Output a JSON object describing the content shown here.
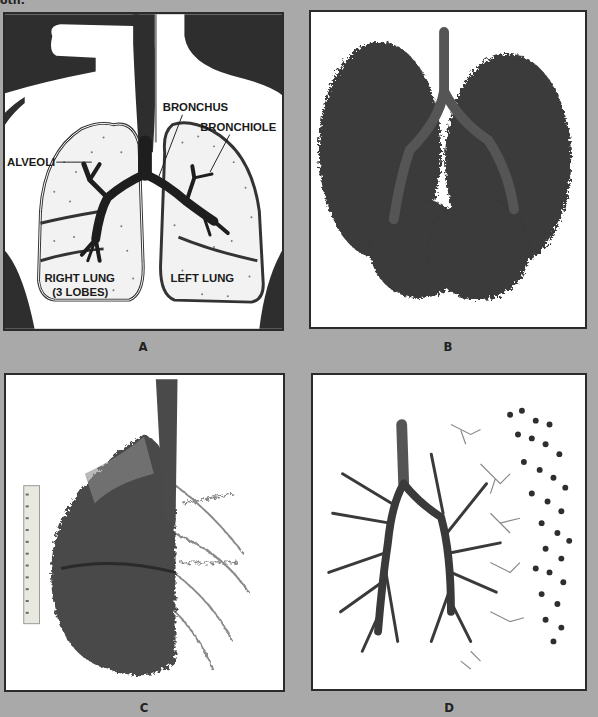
{
  "top_fragment": "oth.",
  "panels": [
    {
      "id": "A",
      "caption": "A",
      "kind": "illustration",
      "labels": {
        "bronchus": "BRONCHUS",
        "bronchiole": "BRONCHIOLE",
        "alveoli": "ALVEOLI",
        "right_lung_line1": "RIGHT LUNG",
        "right_lung_line2": "(3 LOBES)",
        "left_lung": "LEFT LUNG"
      }
    },
    {
      "id": "B",
      "caption": "B",
      "kind": "photo",
      "subject": "bronchial tree cast, frontal view"
    },
    {
      "id": "C",
      "caption": "C",
      "kind": "photo",
      "subject": "lung lobe cast with bronchi and scale ruler"
    },
    {
      "id": "D",
      "caption": "D",
      "kind": "photo",
      "subject": "dissected bronchial tree with separated bronchioles and alveolar clusters"
    }
  ],
  "colors": {
    "background": "#a9a9a9",
    "panel_bg": "#ffffff",
    "panel_border": "#2b2b2b",
    "dark_fill": "#2a2a2a",
    "lung_fill": "#f2f2f2"
  }
}
